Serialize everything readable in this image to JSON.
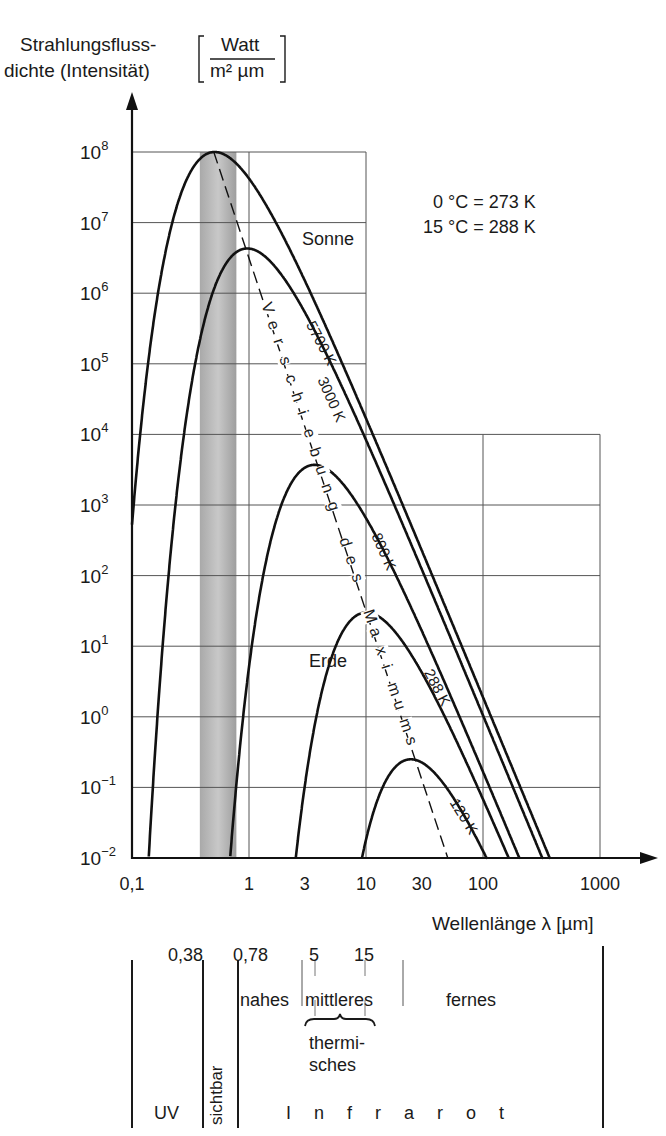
{
  "chart_data": {
    "type": "line",
    "title": "",
    "ylabel": "Strahlungsflussdichte (Intensität) [Watt / (m² µm)]",
    "ylabel_line1": "Strahlungsfluss-",
    "ylabel_line2": "dichte (Intensität)",
    "yunit_numerator": "Watt",
    "yunit_denominator": "m² µm",
    "xlabel": "Wellenlänge λ [µm]",
    "xscale": "log",
    "yscale": "log",
    "xlim": [
      0.1,
      1000
    ],
    "ylim": [
      0.01,
      100000000
    ],
    "x_ticks": [
      {
        "value": 0.1,
        "label": "0,1"
      },
      {
        "value": 1,
        "label": "1"
      },
      {
        "value": 3,
        "label": "3"
      },
      {
        "value": 10,
        "label": "10"
      },
      {
        "value": 30,
        "label": "30"
      },
      {
        "value": 100,
        "label": "100"
      },
      {
        "value": 1000,
        "label": "1000"
      }
    ],
    "y_ticks": [
      {
        "exp": 8,
        "base": "10",
        "sup": "8"
      },
      {
        "exp": 7,
        "base": "10",
        "sup": "7"
      },
      {
        "exp": 6,
        "base": "10",
        "sup": "6"
      },
      {
        "exp": 5,
        "base": "10",
        "sup": "5"
      },
      {
        "exp": 4,
        "base": "10",
        "sup": "4"
      },
      {
        "exp": 3,
        "base": "10",
        "sup": "3"
      },
      {
        "exp": 2,
        "base": "10",
        "sup": "2"
      },
      {
        "exp": 1,
        "base": "10",
        "sup": "1"
      },
      {
        "exp": 0,
        "base": "10",
        "sup": "0"
      },
      {
        "exp": -1,
        "base": "10",
        "sup": "−1"
      },
      {
        "exp": -2,
        "base": "10",
        "sup": "−2"
      }
    ],
    "grid": true,
    "series": [
      {
        "name": "5700 K",
        "temperature_K": 5700,
        "peak_wavelength_um": 0.5,
        "peak_value": 100000000,
        "label": "5700 K",
        "annotation": "Sonne"
      },
      {
        "name": "3000 K",
        "temperature_K": 3000,
        "peak_wavelength_um": 0.97,
        "peak_value": 4300000,
        "label": "3000 K"
      },
      {
        "name": "800 K",
        "temperature_K": 800,
        "peak_wavelength_um": 3.6,
        "peak_value": 3700,
        "label": "800 K"
      },
      {
        "name": "288 K",
        "temperature_K": 288,
        "peak_wavelength_um": 10,
        "peak_value": 30,
        "label": "288 K",
        "annotation": "Erde"
      },
      {
        "name": "120 K",
        "temperature_K": 120,
        "peak_wavelength_um": 24,
        "peak_value": 0.25,
        "label": "120 K"
      }
    ],
    "wien_line": {
      "label": "Verschiebung des Maximums",
      "style": "dashed",
      "from": {
        "x": 0.5,
        "y": 100000000
      },
      "to": {
        "x": 50,
        "y": 0.01
      }
    },
    "visible_band_um": [
      0.38,
      0.78
    ],
    "annotations": [
      "0 °C = 273 K",
      "15 °C = 288 K",
      "Sonne",
      "Erde"
    ]
  },
  "notes": {
    "line1": "0 °C = 273 K",
    "line2": "15 °C = 288 K"
  },
  "curve_labels": {
    "sonne": "Sonne",
    "erde": "Erde",
    "k5700": "5700 K",
    "k3000": "3000 K",
    "k800": "800 K",
    "k288": "288 K",
    "k120": "120 K"
  },
  "wien_label": "Verschiebung des Maximums",
  "spectrum_bands": {
    "boundaries": {
      "b038": "0,38",
      "b078": "0,78",
      "b5": "5",
      "b15": "15"
    },
    "uv": "UV",
    "sichtbar": "sichtbar",
    "nahes": "nahes",
    "mittleres": "mittleres",
    "fernes": "fernes",
    "thermisches_line1": "thermi-",
    "thermisches_line2": "sches",
    "infrarot": "I n f r a r o t"
  }
}
